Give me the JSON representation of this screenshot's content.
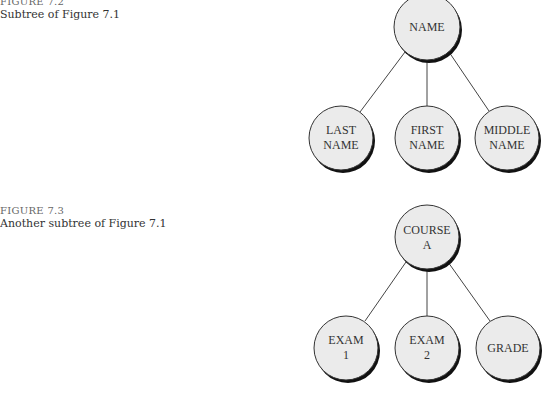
{
  "figures": [
    {
      "label": "FIGURE 7.2",
      "caption": "Subtree of Figure 7.1",
      "root": {
        "lines": [
          "NAME"
        ]
      },
      "children": [
        {
          "lines": [
            "LAST",
            "NAME"
          ]
        },
        {
          "lines": [
            "FIRST",
            "NAME"
          ]
        },
        {
          "lines": [
            "MIDDLE",
            "NAME"
          ]
        }
      ]
    },
    {
      "label": "FIGURE 7.3",
      "caption": "Another subtree of Figure 7.1",
      "root": {
        "lines": [
          "COURSE",
          "A"
        ]
      },
      "children": [
        {
          "lines": [
            "EXAM",
            "1"
          ]
        },
        {
          "lines": [
            "EXAM",
            "2"
          ]
        },
        {
          "lines": [
            "GRADE"
          ]
        }
      ]
    }
  ],
  "colors": {
    "node_fill": "#ebebeb",
    "node_stroke": "#333333",
    "node_shadow": "#111111",
    "edge": "#444444"
  }
}
